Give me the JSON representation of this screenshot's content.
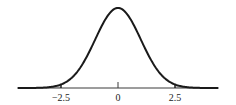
{
  "chart_data": {
    "type": "line",
    "title": "",
    "xlabel": "",
    "ylabel": "",
    "distribution": "normal",
    "mean": 0,
    "std": 1,
    "xlim": [
      -4.4,
      4.4
    ],
    "grid": false,
    "legend": null,
    "x_ticks": [
      {
        "value": -2.5,
        "label": "−2.5"
      },
      {
        "value": 0,
        "label": "0"
      },
      {
        "value": 2.5,
        "label": "2.5"
      }
    ],
    "shaded_regions": [
      {
        "from": -4.4,
        "to": -2.5,
        "label": "left tail"
      },
      {
        "from": 2.5,
        "to": 4.4,
        "label": "right tail"
      }
    ]
  },
  "colors": {
    "curve": "#1a1a1a",
    "axis": "#3a3a3a",
    "shade": "#d4d4d4",
    "background": "#ffffff"
  }
}
